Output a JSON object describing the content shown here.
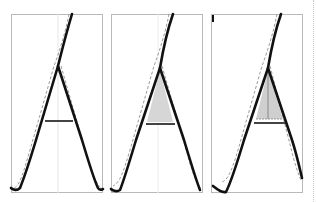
{
  "figure": {
    "panels": [
      {
        "id": "stage-1",
        "fill_counter": false,
        "center_guide": false
      },
      {
        "id": "stage-2",
        "fill_counter": true,
        "center_guide": false
      },
      {
        "id": "stage-3",
        "fill_counter": true,
        "center_guide": true
      }
    ],
    "colors": {
      "stroke": "#111111",
      "outline_dashed": "#9a9a9a",
      "counter_fill": "#d6d6d6",
      "crossbar": "#444444",
      "frame": "#b9b9b9"
    }
  }
}
